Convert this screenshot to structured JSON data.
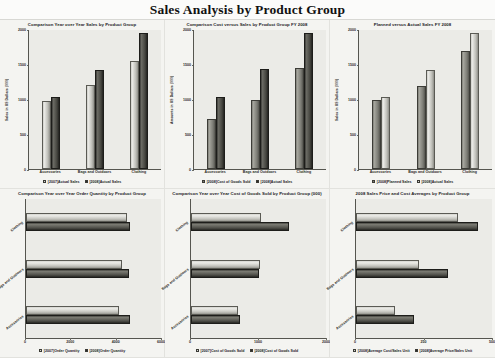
{
  "header": {
    "title": "Sales Analysis by Product Group"
  },
  "categories": [
    "Accessories",
    "Bags and Outdoors",
    "Clothing"
  ],
  "chart_data": [
    {
      "id": "yoy-sales",
      "type": "bar",
      "orientation": "vertical",
      "title": "Comparison Year over Year Sales by Product Group",
      "xlabel": "",
      "ylabel": "Sales in US Dollars (000)",
      "categories": [
        "Accessories",
        "Bags and Outdoors",
        "Clothing"
      ],
      "yticks": [
        0,
        500,
        1000,
        1500,
        2000
      ],
      "ylim": [
        0,
        2000
      ],
      "grid": false,
      "legend_position": "bottom",
      "series": [
        {
          "name": "[2007]Actual Sales",
          "color": "#d5d5d0",
          "values": [
            980,
            1210,
            1560
          ]
        },
        {
          "name": "[2008]Actual Sales",
          "color": "#2c2c28",
          "values": [
            1040,
            1430,
            1950
          ]
        }
      ]
    },
    {
      "id": "cost-vs-sales",
      "type": "bar",
      "orientation": "vertical",
      "title": "Comparison Cost versus Sales by Product Group FY 2008",
      "xlabel": "",
      "ylabel": "Amounts in US Dollars (000)",
      "categories": [
        "Accessories",
        "Bags and Outdoors",
        "Clothing"
      ],
      "yticks": [
        0,
        500,
        1000,
        1500,
        2000
      ],
      "ylim": [
        0,
        2000
      ],
      "grid": false,
      "legend_position": "bottom",
      "series": [
        {
          "name": "[2008]Cost of Goods Sold",
          "color": "#8b8b84",
          "values": [
            720,
            990,
            1450
          ]
        },
        {
          "name": "[2008]Actual Sales",
          "color": "#2c2c28",
          "values": [
            1030,
            1440,
            1950
          ]
        }
      ]
    },
    {
      "id": "planned-vs-actual",
      "type": "bar",
      "orientation": "vertical",
      "title": "Planned versus Actual Sales FY 2008",
      "xlabel": "",
      "ylabel": "Sales in US Dollars (000)",
      "categories": [
        "Accessories",
        "Bags and Outdoors",
        "Clothing"
      ],
      "yticks": [
        0,
        500,
        1000,
        1500,
        2000
      ],
      "ylim": [
        0,
        2000
      ],
      "grid": false,
      "legend_position": "bottom",
      "series": [
        {
          "name": "[2008]Planned Sales",
          "color": "#8b8b84",
          "values": [
            995,
            1200,
            1700
          ]
        },
        {
          "name": "[2008]Actual Sales",
          "color": "#d5d5d0",
          "values": [
            1035,
            1430,
            1950
          ]
        }
      ]
    },
    {
      "id": "yoy-order-quantity",
      "type": "bar",
      "orientation": "horizontal",
      "title": "Comparison Year over Year Order Quantity by Product Group",
      "xlabel": "",
      "ylabel": "",
      "categories": [
        "Accessories",
        "Bags and Outdoors",
        "Clothing"
      ],
      "xticks": [
        0,
        2000,
        4000,
        6000
      ],
      "xlim": [
        0,
        6000
      ],
      "grid": false,
      "legend_position": "bottom",
      "series": [
        {
          "name": "[2007]Order Quantity",
          "color": "#d5d5d0",
          "values": [
            4150,
            4250,
            4480
          ]
        },
        {
          "name": "[2008]Order Quantity",
          "color": "#2c2c28",
          "values": [
            4600,
            4580,
            4620
          ]
        }
      ]
    },
    {
      "id": "yoy-cogs",
      "type": "bar",
      "orientation": "horizontal",
      "title": "Comparison Year over Year Cost of Goods Sold by Product Group (000)",
      "xlabel": "",
      "ylabel": "",
      "categories": [
        "Accessories",
        "Bags and Outdoors",
        "Clothing"
      ],
      "xticks": [
        0,
        1000,
        2000
      ],
      "xlim": [
        0,
        2000
      ],
      "grid": false,
      "legend_position": "bottom",
      "series": [
        {
          "name": "[2007]Cost of Goods Sold",
          "color": "#d5d5d0",
          "values": [
            700,
            1020,
            1040
          ]
        },
        {
          "name": "[2008]Cost of Goods Sold",
          "color": "#2c2c28",
          "values": [
            720,
            1000,
            1450
          ]
        }
      ]
    },
    {
      "id": "price-cost-averages",
      "type": "bar",
      "orientation": "horizontal",
      "title": "2008 Sales Price and Cost Averages by Product Group",
      "xlabel": "",
      "ylabel": "",
      "categories": [
        "Accessories",
        "Bags and Outdoors",
        "Clothing"
      ],
      "xticks": [
        0,
        250,
        500
      ],
      "xlim": [
        0,
        500
      ],
      "grid": false,
      "legend_position": "bottom",
      "series": [
        {
          "name": "[2008]Average Cost/Sales Unit",
          "color": "#d5d5d0",
          "values": [
            145,
            230,
            375
          ]
        },
        {
          "name": "[2008]Average Price/Sales Unit",
          "color": "#2c2c28",
          "values": [
            215,
            340,
            450
          ]
        }
      ]
    }
  ]
}
